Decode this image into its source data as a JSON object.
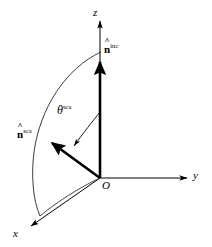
{
  "figure": {
    "background_color": "#ffffff",
    "stroke_color": "#000000",
    "width": 212,
    "height": 247
  },
  "axes": [
    {
      "key": "z",
      "label": "z",
      "name": "z-axis",
      "direction": "up",
      "from": [
        100,
        178
      ],
      "to": [
        100,
        20
      ]
    },
    {
      "key": "y",
      "label": "y",
      "name": "y-axis",
      "direction": "right",
      "from": [
        100,
        178
      ],
      "to": [
        188,
        178
      ]
    },
    {
      "key": "x",
      "label": "x",
      "name": "x-axis",
      "direction": "down-left",
      "from": [
        100,
        178
      ],
      "to": [
        30,
        227
      ]
    }
  ],
  "origin": {
    "label": "O",
    "position": [
      100,
      178
    ]
  },
  "vectors": [
    {
      "key": "n_inc",
      "symbol": "n",
      "accent": "hat",
      "superscript": "inc",
      "name": "incident-direction-vector",
      "from": [
        100,
        178
      ],
      "to": [
        100,
        58
      ],
      "label_position": [
        105,
        42
      ]
    },
    {
      "key": "n_sca",
      "symbol": "n",
      "accent": "hat",
      "superscript": "sca",
      "name": "scattered-direction-vector",
      "from": [
        100,
        178
      ],
      "to": [
        49,
        141
      ],
      "label_position": [
        16,
        126
      ]
    }
  ],
  "angle": {
    "key": "theta_sca",
    "symbol": "θ",
    "superscript": "sca",
    "name": "scattering-angle",
    "between": [
      "n_inc",
      "n_sca"
    ],
    "vertex": [
      100,
      178
    ],
    "label_position": [
      57,
      104
    ]
  },
  "arc": {
    "name": "meridian-arc",
    "description": "thin curve from z-axis through scattered direction down to x-axis",
    "start": [
      101,
      52
    ],
    "end": [
      40,
      216
    ]
  },
  "colors": {
    "stroke": "#000000",
    "background": "#ffffff",
    "thin_line": "#1a1a1a"
  }
}
